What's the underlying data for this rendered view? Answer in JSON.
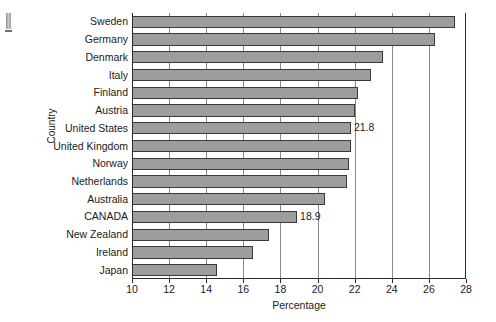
{
  "chart_data": {
    "type": "bar",
    "orientation": "horizontal",
    "title": "",
    "xlabel": "Percentage",
    "ylabel": "Country",
    "xlim": [
      10,
      28
    ],
    "xticks": [
      10,
      12,
      14,
      16,
      18,
      20,
      22,
      24,
      26,
      28
    ],
    "grid": true,
    "legend": null,
    "bar_color": "#9d9d9d",
    "bar_edge_color": "#3a3a3a",
    "categories": [
      "Sweden",
      "Germany",
      "Denmark",
      "Italy",
      "Finland",
      "Austria",
      "United States",
      "United Kingdom",
      "Norway",
      "Netherlands",
      "Australia",
      "CANADA",
      "New Zealand",
      "Ireland",
      "Japan"
    ],
    "values": [
      27.4,
      26.3,
      23.5,
      22.9,
      22.2,
      22.0,
      21.8,
      21.8,
      21.7,
      21.6,
      20.4,
      18.9,
      17.4,
      16.5,
      14.6
    ],
    "annotations": [
      {
        "category": "United States",
        "text": "21.8",
        "value": 21.8
      },
      {
        "category": "CANADA",
        "text": "18.9",
        "value": 18.9
      }
    ]
  }
}
